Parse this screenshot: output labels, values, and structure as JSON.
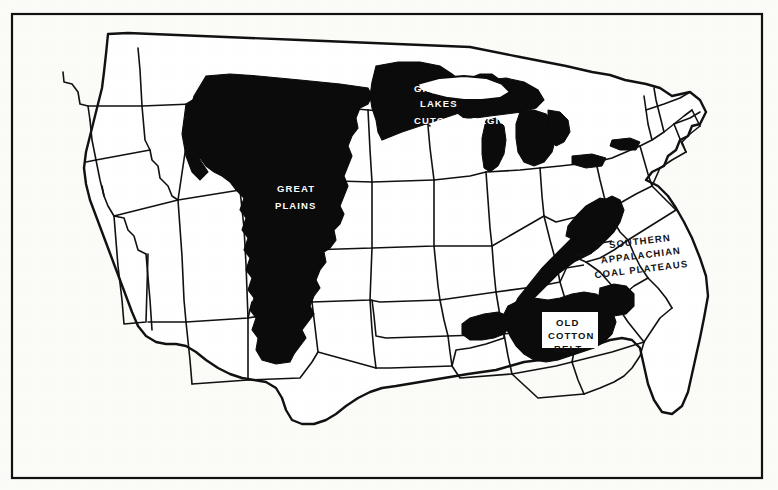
{
  "map": {
    "title": "United States problem regions map",
    "frame": {
      "x": 12,
      "y": 14,
      "width": 750,
      "height": 464,
      "stroke": "#111111"
    },
    "background_color": "#fbfbf8",
    "land_color": "#ffffff",
    "outline_color": "#111111",
    "region_fill_color": "#0b0b0b",
    "labels": [
      {
        "id": "great-lakes-cutover-region",
        "lines": [
          "GREAT",
          "LAKES",
          "CUTOVER REGION"
        ],
        "style": "white-on-black",
        "x": 414,
        "y": 86
      },
      {
        "id": "great-plains",
        "lines": [
          "GREAT",
          "PLAINS"
        ],
        "style": "white-on-black",
        "x": 277,
        "y": 190
      },
      {
        "id": "southern-appalachian-coal-plateaus",
        "lines": [
          "SOUTHERN",
          "APPALACHIAN",
          "COAL PLATEAUS"
        ],
        "style": "black-on-white",
        "x": 600,
        "y": 250
      },
      {
        "id": "old-cotton-belt",
        "lines": [
          "OLD",
          "COTTON",
          "BELT"
        ],
        "style": "black-on-knockout",
        "x": 568,
        "y": 329
      }
    ],
    "regions": [
      {
        "id": "great-plains",
        "label": "GREAT PLAINS"
      },
      {
        "id": "great-lakes-cutover-region",
        "label": "GREAT LAKES CUTOVER REGION"
      },
      {
        "id": "southern-appalachian-coal-plateaus",
        "label": "SOUTHERN APPALACHIAN COAL PLATEAUS"
      },
      {
        "id": "old-cotton-belt",
        "label": "OLD COTTON BELT"
      }
    ]
  }
}
